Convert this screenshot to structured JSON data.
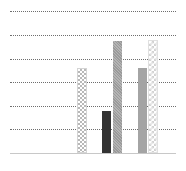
{
  "chart_data": {
    "type": "bar",
    "title": "",
    "xlabel": "",
    "ylabel": "",
    "categories": [
      "",
      "",
      ""
    ],
    "series": [
      {
        "name": "",
        "group": 0,
        "value": 3.6,
        "pattern": "checker",
        "color": "#b8b8b8"
      },
      {
        "name": "",
        "group": 1,
        "value": 1.8,
        "pattern": "solid-dark",
        "color": "#333333"
      },
      {
        "name": "",
        "group": 1,
        "value": 4.75,
        "pattern": "hatch",
        "color": "#a8a8a8"
      },
      {
        "name": "",
        "group": 2,
        "value": 3.6,
        "pattern": "solid-grey",
        "color": "#a4a4a4"
      },
      {
        "name": "",
        "group": 2,
        "value": 4.8,
        "pattern": "checker-light",
        "color": "#d2d2d2"
      }
    ],
    "ylim": [
      0,
      6
    ],
    "gridlines": [
      1,
      2,
      3,
      4,
      5,
      6
    ],
    "grid": true,
    "grid_style": "dotted",
    "legend": null,
    "tick_labels_visible": false
  },
  "layout": {
    "plot_left": 10,
    "plot_right": 176,
    "baseline_y": 153,
    "unit_px": 23.6,
    "bars_px": [
      {
        "x": 77,
        "w": 10
      },
      {
        "x": 102,
        "w": 9
      },
      {
        "x": 113,
        "w": 9
      },
      {
        "x": 138,
        "w": 9
      },
      {
        "x": 148,
        "w": 10
      }
    ]
  }
}
